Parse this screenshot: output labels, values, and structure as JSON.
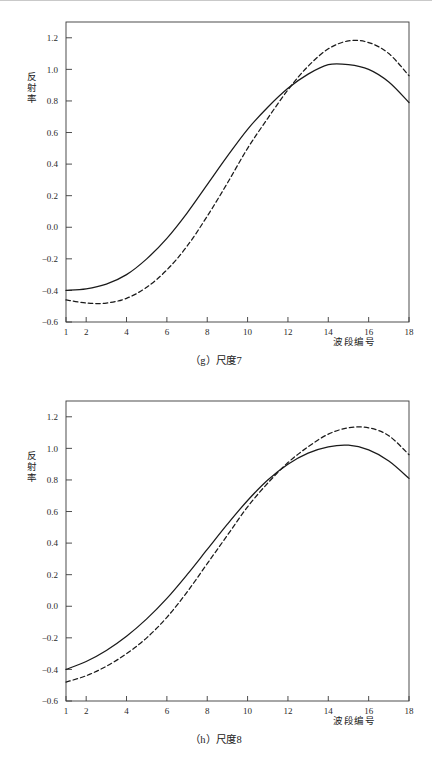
{
  "page": {
    "background": "#ffffff",
    "rule_color": "#c9c9c9"
  },
  "figures": [
    {
      "id": "g",
      "caption": "（g）尺度7",
      "ylabel": "反射率",
      "xlabel": "波段编号",
      "chart_data": {
        "type": "line",
        "title": "",
        "xlabel": "波段编号",
        "ylabel": "反射率",
        "xlim": [
          1,
          18
        ],
        "ylim": [
          -0.6,
          1.3
        ],
        "xticks": [
          1,
          2,
          4,
          6,
          8,
          10,
          12,
          14,
          16,
          18
        ],
        "xticklabels": [
          "1",
          "2",
          "4",
          "6",
          "8",
          "10",
          "12",
          "14",
          "16",
          "18"
        ],
        "yticks": [
          -0.6,
          -0.4,
          -0.2,
          0.0,
          0.2,
          0.4,
          0.6,
          0.8,
          1.0,
          1.2
        ],
        "yticklabels": [
          "-0.6",
          "-0.4",
          "-0.2",
          "0.0",
          "0.2",
          "0.4",
          "0.6",
          "0.8",
          "1.0",
          "1.2"
        ],
        "grid": false,
        "legend": "none",
        "x": [
          1,
          2,
          3,
          4,
          5,
          6,
          7,
          8,
          9,
          10,
          11,
          12,
          13,
          14,
          15,
          16,
          17,
          18
        ],
        "series": [
          {
            "name": "solid",
            "style": "solid",
            "color": "#1a1a1a",
            "values": [
              -0.4,
              -0.39,
              -0.36,
              -0.3,
              -0.2,
              -0.07,
              0.09,
              0.27,
              0.45,
              0.62,
              0.76,
              0.88,
              0.97,
              1.03,
              1.03,
              1.0,
              0.92,
              0.79
            ]
          },
          {
            "name": "dashed",
            "style": "dashed",
            "color": "#1a1a1a",
            "values": [
              -0.46,
              -0.48,
              -0.48,
              -0.45,
              -0.38,
              -0.27,
              -0.12,
              0.07,
              0.28,
              0.5,
              0.69,
              0.87,
              1.02,
              1.13,
              1.18,
              1.17,
              1.1,
              0.96
            ]
          }
        ]
      }
    },
    {
      "id": "h",
      "caption": "（h）尺度8",
      "ylabel": "反射率",
      "xlabel": "波段编号",
      "chart_data": {
        "type": "line",
        "title": "",
        "xlabel": "波段编号",
        "ylabel": "反射率",
        "xlim": [
          1,
          18
        ],
        "ylim": [
          -0.6,
          1.3
        ],
        "xticks": [
          1,
          2,
          4,
          6,
          8,
          10,
          12,
          14,
          16,
          18
        ],
        "xticklabels": [
          "1",
          "2",
          "4",
          "6",
          "8",
          "10",
          "12",
          "14",
          "16",
          "18"
        ],
        "yticks": [
          -0.6,
          -0.4,
          -0.2,
          0.0,
          0.2,
          0.4,
          0.6,
          0.8,
          1.0,
          1.2
        ],
        "yticklabels": [
          "-0.6",
          "-0.4",
          "-0.2",
          "0.0",
          "0.2",
          "0.4",
          "0.6",
          "0.8",
          "1.0",
          "1.2"
        ],
        "grid": false,
        "legend": "none",
        "x": [
          1,
          2,
          3,
          4,
          5,
          6,
          7,
          8,
          9,
          10,
          11,
          12,
          13,
          14,
          15,
          16,
          17,
          18
        ],
        "series": [
          {
            "name": "solid",
            "style": "solid",
            "color": "#1a1a1a",
            "values": [
              -0.4,
              -0.35,
              -0.28,
              -0.19,
              -0.08,
              0.05,
              0.2,
              0.36,
              0.52,
              0.67,
              0.8,
              0.9,
              0.97,
              1.01,
              1.02,
              0.99,
              0.92,
              0.81
            ]
          },
          {
            "name": "dashed",
            "style": "dashed",
            "color": "#1a1a1a",
            "values": [
              -0.48,
              -0.44,
              -0.38,
              -0.3,
              -0.2,
              -0.07,
              0.09,
              0.27,
              0.45,
              0.63,
              0.78,
              0.91,
              1.01,
              1.09,
              1.13,
              1.13,
              1.08,
              0.96
            ]
          }
        ]
      }
    }
  ]
}
